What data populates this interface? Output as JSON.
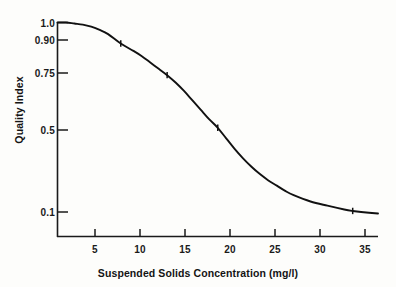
{
  "chart_data": {
    "type": "line",
    "title": "",
    "xlabel": "Suspended Solids Concentration  (mg/l)",
    "ylabel": "Quality Index",
    "xlim": [
      0,
      38
    ],
    "ylim": [
      0.05,
      1.02
    ],
    "grid": false,
    "legend": null,
    "xticks": [
      5,
      10,
      15,
      20,
      25,
      30,
      35
    ],
    "xtick_labels": [
      "5",
      "10",
      "15",
      "20",
      "25",
      "30",
      "35"
    ],
    "yticks": [
      1.0,
      0.9,
      0.75,
      0.5,
      0.1
    ],
    "ytick_labels": [
      "1.0",
      "0.90",
      "0.75",
      "0.5",
      "0.1"
    ],
    "series": [
      {
        "name": "Quality Index",
        "x": [
          0,
          1,
          2,
          3,
          4,
          5,
          6,
          7.5,
          9,
          10,
          11,
          12,
          13,
          14,
          15,
          16,
          17,
          18,
          19,
          20,
          21,
          22,
          23,
          24,
          25,
          26,
          27,
          28,
          30,
          32,
          34,
          35,
          36,
          38
        ],
        "y": [
          1.0,
          1.0,
          0.995,
          0.99,
          0.98,
          0.965,
          0.945,
          0.9,
          0.865,
          0.84,
          0.81,
          0.78,
          0.75,
          0.715,
          0.675,
          0.63,
          0.585,
          0.54,
          0.5,
          0.45,
          0.4,
          0.355,
          0.315,
          0.28,
          0.25,
          0.225,
          0.2,
          0.18,
          0.15,
          0.13,
          0.112,
          0.105,
          0.1,
          0.093
        ]
      }
    ],
    "markers": [
      {
        "x": 7.5,
        "y": 0.9
      },
      {
        "x": 13,
        "y": 0.75
      },
      {
        "x": 19,
        "y": 0.5
      },
      {
        "x": 35,
        "y": 0.105
      }
    ],
    "line_color": "#111111",
    "axis_color": "#1a1a1a",
    "background_color": "#fdfdfb"
  }
}
